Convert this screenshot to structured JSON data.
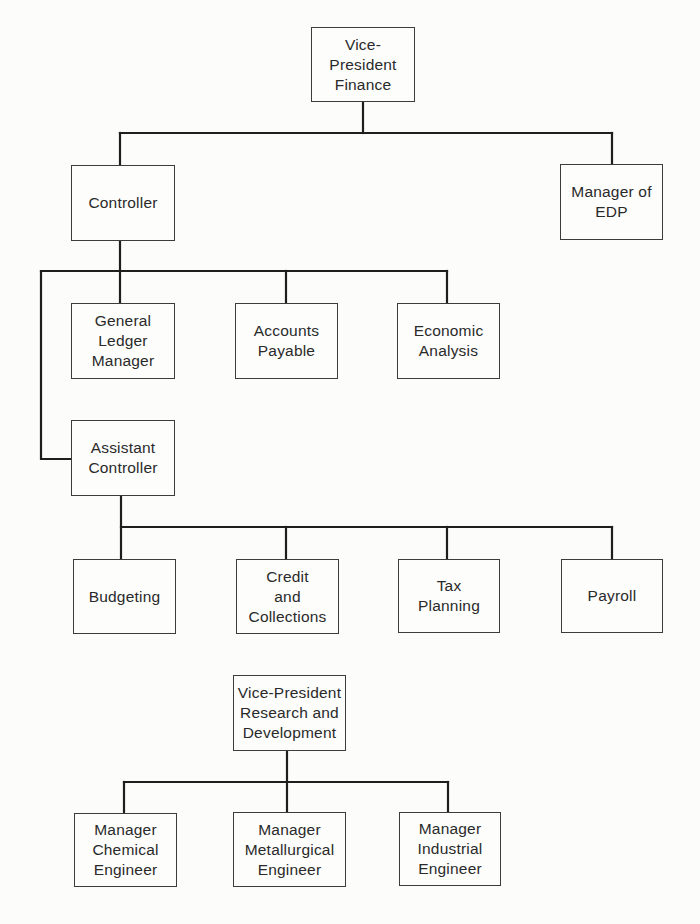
{
  "diagram": {
    "type": "organization-chart",
    "charts": [
      {
        "id": "finance",
        "root": "vp_finance"
      },
      {
        "id": "research",
        "root": "vp_rd"
      }
    ],
    "nodes": {
      "vp_finance": {
        "label": "Vice-\nPresident\nFinance",
        "parent": null
      },
      "controller": {
        "label": "Controller",
        "parent": "vp_finance"
      },
      "manager_edp": {
        "label": "Manager of\nEDP",
        "parent": "vp_finance"
      },
      "general_ledger": {
        "label": "General\nLedger\nManager",
        "parent": "controller"
      },
      "accounts_payable": {
        "label": "Accounts\nPayable",
        "parent": "controller"
      },
      "economic_analysis": {
        "label": "Economic\nAnalysis",
        "parent": "controller"
      },
      "assistant_controller": {
        "label": "Assistant\nController",
        "parent": "controller"
      },
      "budgeting": {
        "label": "Budgeting",
        "parent": "assistant_controller"
      },
      "credit_collections": {
        "label": "Credit\nand\nCollections",
        "parent": "assistant_controller"
      },
      "tax_planning": {
        "label": "Tax\nPlanning",
        "parent": "assistant_controller"
      },
      "payroll": {
        "label": "Payroll",
        "parent": "assistant_controller"
      },
      "vp_rd": {
        "label": "Vice-President\nResearch and\nDevelopment",
        "parent": null
      },
      "mgr_chemical": {
        "label": "Manager\nChemical\nEngineer",
        "parent": "vp_rd"
      },
      "mgr_metallurgical": {
        "label": "Manager\nMetallurgical\nEngineer",
        "parent": "vp_rd"
      },
      "mgr_industrial": {
        "label": "Manager\nIndustrial\nEngineer",
        "parent": "vp_rd"
      }
    },
    "colors": {
      "background": "#fcfcfb",
      "line": "#1e1e1e",
      "box_border": "#3c3c3c",
      "text": "#2a2a2a"
    }
  }
}
